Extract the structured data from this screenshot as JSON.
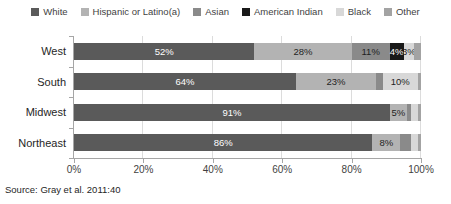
{
  "chart_data": {
    "type": "bar",
    "stacked": true,
    "orientation": "horizontal",
    "title": "",
    "categories": [
      "West",
      "South",
      "Midwest",
      "Northeast"
    ],
    "series": [
      {
        "name": "White",
        "color": "#5a5a5a",
        "label_color": "#ffffff",
        "values": [
          52,
          64,
          91,
          86
        ],
        "labels": [
          "52%",
          "64%",
          "91%",
          "86%"
        ]
      },
      {
        "name": "Hispanic or Latino(a)",
        "color": "#b3b3b3",
        "label_color": "#1f1f1f",
        "values": [
          28,
          23,
          5,
          8
        ],
        "labels": [
          "28%",
          "23%",
          "5%",
          "8%"
        ]
      },
      {
        "name": "Asian",
        "color": "#8a8a8a",
        "label_color": "#1f1f1f",
        "values": [
          11,
          2,
          1,
          3
        ],
        "labels": [
          "11%",
          "",
          "",
          ""
        ]
      },
      {
        "name": "American Indian",
        "color": "#191919",
        "label_color": "#ffffff",
        "values": [
          4,
          0,
          0,
          0
        ],
        "labels": [
          "4%",
          "",
          "",
          ""
        ]
      },
      {
        "name": "Black",
        "color": "#d8d8d8",
        "label_color": "#1f1f1f",
        "values": [
          3,
          10,
          2,
          2
        ],
        "labels": [
          "3%",
          "10%",
          "",
          ""
        ]
      },
      {
        "name": "Other",
        "color": "#a3a3a3",
        "label_color": "#1f1f1f",
        "values": [
          2,
          1,
          1,
          1
        ],
        "labels": [
          "",
          "",
          "",
          ""
        ]
      }
    ],
    "xlim": [
      0,
      100
    ],
    "x_tick_labels": [
      "0%",
      "20%",
      "40%",
      "60%",
      "80%",
      "100%"
    ],
    "gridline_percents": [
      20,
      40,
      60,
      80,
      100
    ],
    "legend_position": "top",
    "grid": true,
    "axis_color": "#a6a6a6",
    "grid_color": "#dcdcdc"
  },
  "source_note": "Source: Gray et al. 2011:40"
}
